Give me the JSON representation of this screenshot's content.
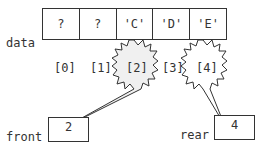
{
  "diagram": {
    "array_label": "data",
    "cells": [
      "?",
      "?",
      "'C'",
      "'D'",
      "'E'"
    ],
    "indices": [
      "[0]",
      "[1]",
      "[2]",
      "[3]",
      "[4]"
    ],
    "highlighted_indices": [
      2,
      4
    ],
    "front": {
      "label": "front",
      "value": "2",
      "points_to_index": 2
    },
    "rear": {
      "label": "rear",
      "value": "4",
      "points_to_index": 4
    },
    "colors": {
      "line": "#333333",
      "starburst_fill": "#f0f0f0",
      "text": "#333333"
    }
  }
}
